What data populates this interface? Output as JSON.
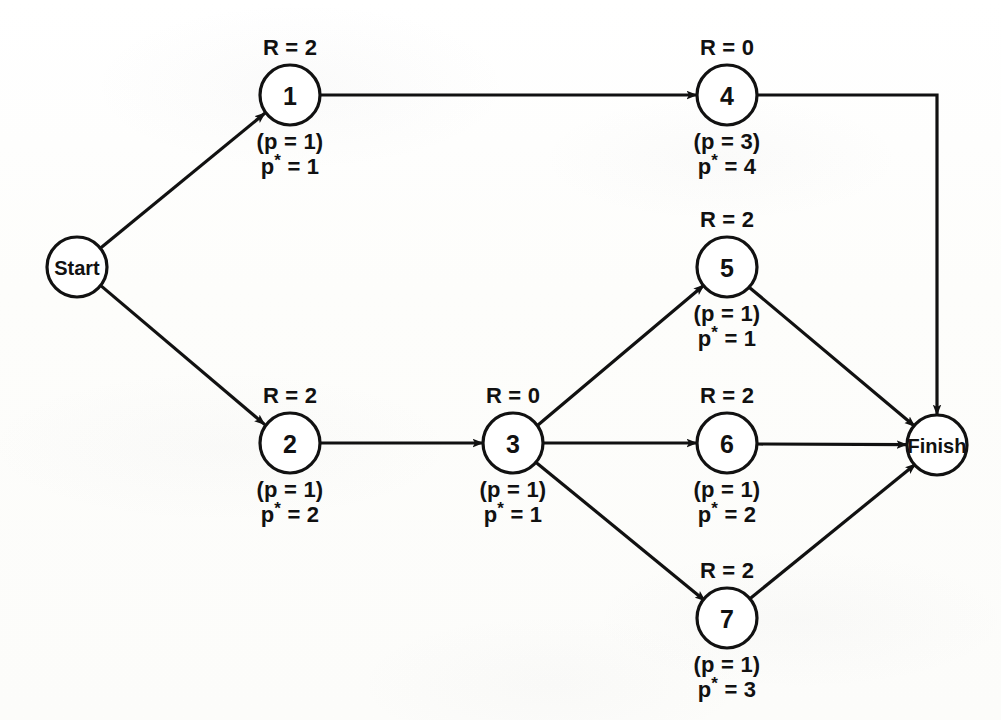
{
  "diagram": {
    "type": "activity-on-node network",
    "stroke_color": "#111111",
    "background_color": "#fdfdfc",
    "node_radius": 30,
    "label_keys": {
      "resource_prefix": "R = ",
      "priority_open": "(p = ",
      "priority_close": ")",
      "priority_star_prefix": "p",
      "star": "*",
      "priority_star_mid": " = "
    },
    "nodes": [
      {
        "id": "start",
        "label": "Start",
        "kind": "terminal",
        "cx": 77,
        "cy": 267,
        "r": 30,
        "above": "",
        "below_1": "",
        "below_2": ""
      },
      {
        "id": "n1",
        "label": "1",
        "kind": "activity",
        "cx": 290,
        "cy": 95,
        "r": 30,
        "above": "R = 2",
        "below_1": "(p = 1)",
        "below_2_prefix": "p",
        "below_2_suffix": " = 1"
      },
      {
        "id": "n2",
        "label": "2",
        "kind": "activity",
        "cx": 290,
        "cy": 443,
        "r": 30,
        "above": "R = 2",
        "below_1": "(p = 1)",
        "below_2_prefix": "p",
        "below_2_suffix": " = 2"
      },
      {
        "id": "n3",
        "label": "3",
        "kind": "activity",
        "cx": 513,
        "cy": 443,
        "r": 30,
        "above": "R = 0",
        "below_1": "(p = 1)",
        "below_2_prefix": "p",
        "below_2_suffix": " = 1"
      },
      {
        "id": "n4",
        "label": "4",
        "kind": "activity",
        "cx": 727,
        "cy": 95,
        "r": 30,
        "above": "R = 0",
        "below_1": "(p = 3)",
        "below_2_prefix": "p",
        "below_2_suffix": " = 4"
      },
      {
        "id": "n5",
        "label": "5",
        "kind": "activity",
        "cx": 727,
        "cy": 267,
        "r": 30,
        "above": "R = 2",
        "below_1": "(p = 1)",
        "below_2_prefix": "p",
        "below_2_suffix": " = 1"
      },
      {
        "id": "n6",
        "label": "6",
        "kind": "activity",
        "cx": 727,
        "cy": 443,
        "r": 30,
        "above": "R = 2",
        "below_1": "(p = 1)",
        "below_2_prefix": "p",
        "below_2_suffix": " = 2"
      },
      {
        "id": "n7",
        "label": "7",
        "kind": "activity",
        "cx": 727,
        "cy": 618,
        "r": 30,
        "above": "R = 2",
        "below_1": "(p = 1)",
        "below_2_prefix": "p",
        "below_2_suffix": " = 3"
      },
      {
        "id": "finish",
        "label": "Finish",
        "kind": "terminal",
        "cx": 937,
        "cy": 445,
        "r": 30,
        "above": "",
        "below_1": "",
        "below_2": ""
      }
    ],
    "edges": [
      {
        "id": "e-start-1",
        "from": "start",
        "to": "n1",
        "style": "straight"
      },
      {
        "id": "e-start-2",
        "from": "start",
        "to": "n2",
        "style": "straight"
      },
      {
        "id": "e-1-4",
        "from": "n1",
        "to": "n4",
        "style": "straight"
      },
      {
        "id": "e-2-3",
        "from": "n2",
        "to": "n3",
        "style": "straight"
      },
      {
        "id": "e-3-5",
        "from": "n3",
        "to": "n5",
        "style": "straight"
      },
      {
        "id": "e-3-6",
        "from": "n3",
        "to": "n6",
        "style": "straight"
      },
      {
        "id": "e-3-7",
        "from": "n3",
        "to": "n7",
        "style": "straight"
      },
      {
        "id": "e-4-finish",
        "from": "n4",
        "to": "finish",
        "style": "orthogonal-right-down"
      },
      {
        "id": "e-5-finish",
        "from": "n5",
        "to": "finish",
        "style": "straight"
      },
      {
        "id": "e-6-finish",
        "from": "n6",
        "to": "finish",
        "style": "straight"
      },
      {
        "id": "e-7-finish",
        "from": "n7",
        "to": "finish",
        "style": "straight"
      }
    ]
  }
}
